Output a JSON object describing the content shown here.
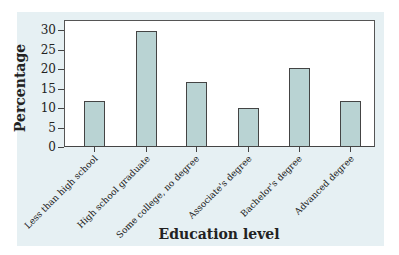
{
  "chart_data": {
    "type": "bar",
    "title": "",
    "xlabel": "Education level",
    "ylabel": "Percentage",
    "categories": [
      "Less than high school",
      "High school graduate",
      "Some college, no degree",
      "Associate's degree",
      "Bachelor's degree",
      "Advanced degree"
    ],
    "values": [
      11.7,
      29.7,
      16.7,
      10.0,
      20.3,
      11.9
    ],
    "ylim": [
      0,
      32
    ],
    "yticks": [
      0,
      5,
      10,
      15,
      20,
      25,
      30
    ],
    "grid": false,
    "legend": null,
    "colors": {
      "bar_fill": "#b9d3d3",
      "bar_edge": "#444444",
      "panel_bg": "#e6f0f3",
      "plot_bg": "#ffffff"
    }
  },
  "axes": {
    "x_title": "Education level",
    "y_title": "Percentage",
    "y_tick_labels": [
      "0",
      "5",
      "10",
      "15",
      "20",
      "25",
      "30"
    ],
    "x_tick_labels": [
      "Less than high school",
      "High school graduate",
      "Some college, no degree",
      "Associate's degree",
      "Bachelor's degree",
      "Advanced degree"
    ]
  }
}
